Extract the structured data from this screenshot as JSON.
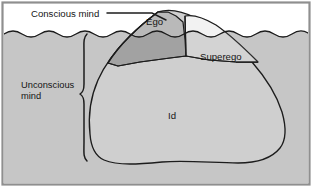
{
  "diagram": {
    "type": "freud-iceberg",
    "labels": {
      "conscious": "Conscious mind",
      "unconscious_line1": "Unconscious",
      "unconscious_line2": "mind",
      "ego": "Ego",
      "superego": "Superego",
      "id": "Id"
    },
    "regions": [
      {
        "name": "sky",
        "label": "",
        "position": "above-waterline",
        "fill": "#ffffff"
      },
      {
        "name": "water",
        "label": "",
        "position": "below-waterline",
        "fill": "#c6c6c6"
      },
      {
        "name": "ego",
        "label": "Ego",
        "position": "above-and-below-waterline",
        "fill": "#b9b9b9"
      },
      {
        "name": "superego",
        "label": "Superego",
        "position": "crosses-waterline-right",
        "fill": "#f2f2f2"
      },
      {
        "name": "id",
        "label": "Id",
        "position": "deep-below-waterline",
        "fill": "#cfcfcf"
      }
    ],
    "annotations": [
      {
        "name": "conscious-leader-line",
        "text": "Conscious mind",
        "points_to": "ego"
      },
      {
        "name": "unconscious-brace",
        "text": "Unconscious mind",
        "spans": "below-waterline"
      }
    ],
    "colors": {
      "sky": "#ffffff",
      "water": "#c6c6c6",
      "ego_fill": "#b9b9b9",
      "ego_submerged_fill": "#c2c2c2",
      "superego_fill": "#f2f2f2",
      "superego_submerged_fill": "#e3e3e3",
      "id_fill": "#cfcfcf",
      "outline": "#1c1c1c",
      "frame": "#8f8f8f",
      "text": "#151515"
    }
  }
}
